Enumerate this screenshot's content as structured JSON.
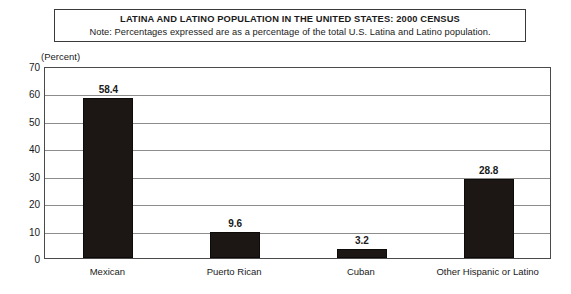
{
  "chart_data": {
    "type": "bar",
    "title": "LATINA AND LATINO POPULATION IN THE UNITED STATES: 2000 CENSUS",
    "note": "Note: Percentages expressed are as a percentage of the total U.S. Latina and Latino population.",
    "ylabel": "(Percent)",
    "xlabel": "",
    "categories": [
      "Mexican",
      "Puerto Rican",
      "Cuban",
      "Other Hispanic or Latino"
    ],
    "values": [
      58.4,
      9.6,
      3.2,
      28.8
    ],
    "value_labels": [
      "58.4",
      "9.6",
      "3.2",
      "28.8"
    ],
    "ylim": [
      0,
      70
    ],
    "ytick_step": 10,
    "yticks": [
      "70",
      "60",
      "50",
      "40",
      "30",
      "20",
      "10",
      "0"
    ],
    "ytick_values": [
      70,
      60,
      50,
      40,
      30,
      20,
      10,
      0
    ],
    "grid": true,
    "legend": "none",
    "bar_color": "#1c1714",
    "plot_background": "#ffffff",
    "gridline_color": "#8c8c8c",
    "border_color": "#4a4a4a"
  }
}
